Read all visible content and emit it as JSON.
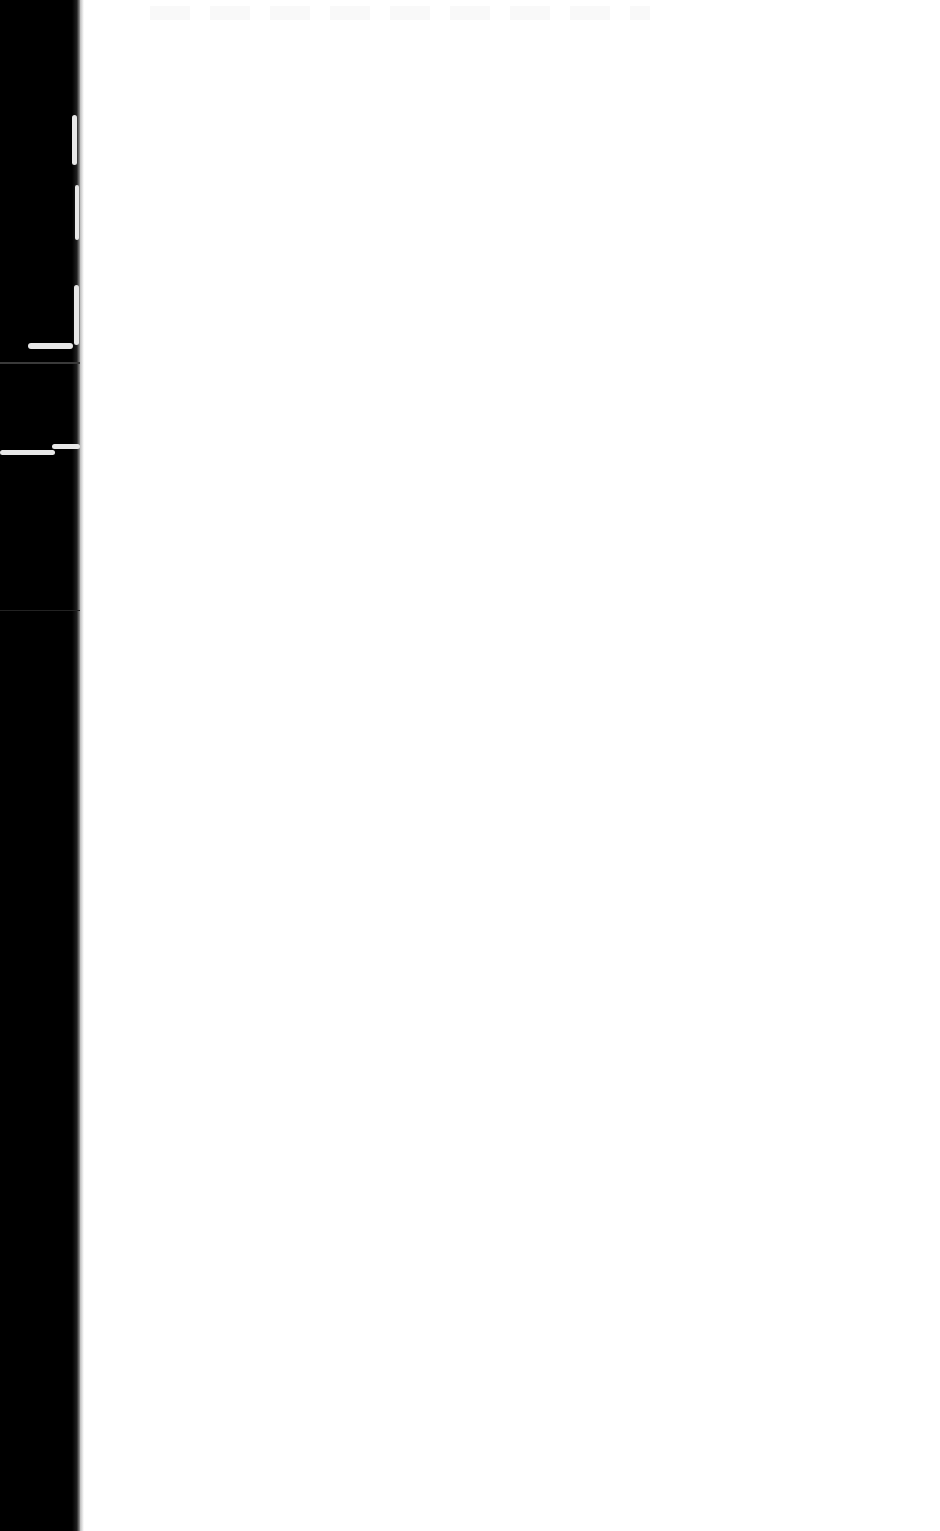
{
  "document": {
    "type": "scanned-page",
    "content": "",
    "background_color": "#ffffff",
    "border_color": "#000000"
  }
}
